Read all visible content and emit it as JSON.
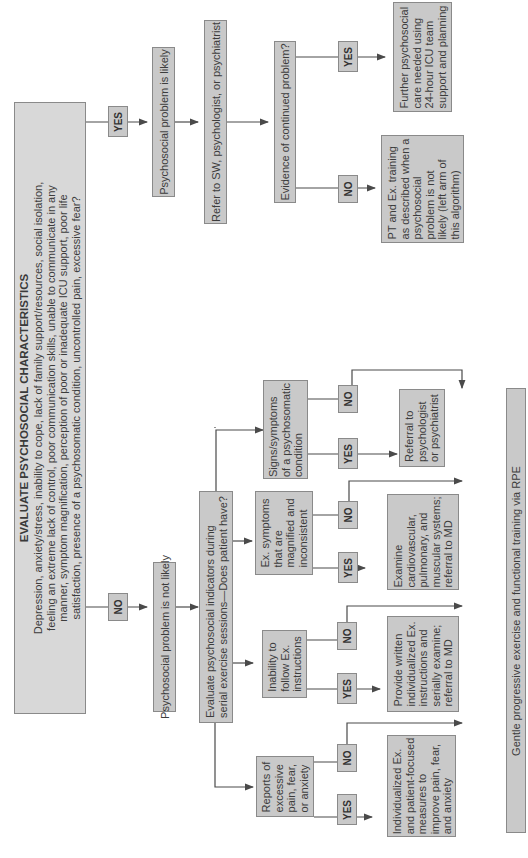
{
  "main": {
    "title": "EVALUATE PSYCHOSOCIAL CHARACTERISTICS",
    "text": "Depression, anxiety/stress, inability to cope, lack of family support/resources, social isolation,\nfeeling an extreme lack of control, poor communication skills, unable to communicate in any\nmanner, symptom magnification, perception of poor or inadequate ICU support, poor life\nsatisfaction, presence of a psychosomatic condition, uncontrolled pain, excessive fear?"
  },
  "labels": {
    "yes": "YES",
    "no": "NO"
  },
  "yes_branch": {
    "likely": "Psychosocial problem is likely",
    "refer": "Refer to SW, psychologist, or psychiatrist",
    "evidence": "Evidence of continued problem?",
    "further_care": "Further psychosocial\ncare needed using\n24-hour ICU team\nsupport and planning",
    "pt_training": "PT and Ex. training\nas described when a\npsychosocial\nproblem is not\nlikely (left arm of\nthis algorithm)"
  },
  "no_branch": {
    "not_likely": "Psychosocial problem is not likely",
    "evaluate": "Evaluate psychosocial indicators during\nserial exercise sessions—Does patient have?",
    "indicators": [
      {
        "condition": "Reports of\nexcessive\npain, fear,\nor anxiety",
        "action": "Individualized Ex.\nand patient-focused\nmeasures to\nimprove pain, fear,\nand anxiety"
      },
      {
        "condition": "Inability to\nfollow Ex.\ninstructions",
        "action": "Provide written\nindividualized Ex.\ninstructions and\nserially examine;\nreferral to MD"
      },
      {
        "condition": "Ex. symptoms\nthat are\nmagnified and\ninconsistent",
        "action": "Examine\ncardiovascular,\npulmonary, and\nmuscular systems;\nreferral to MD"
      },
      {
        "condition": "Signs/symptoms\nof a psychosomatic\ncondition",
        "action": "Referral to\npsychologist\nor psychiatrist"
      }
    ],
    "final": "Gentle progressive exercise and functional training via RPE"
  },
  "colors": {
    "box_fill": "#c9c9c9",
    "box_border": "#8a8a8a",
    "line": "#4a4a4a"
  }
}
